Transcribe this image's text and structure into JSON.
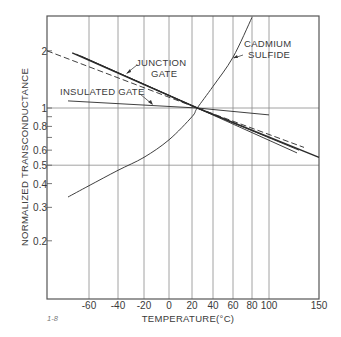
{
  "chart_data": {
    "type": "line",
    "title": "",
    "figure_label": "1-8",
    "xlabel": "TEMPERATURE(°C)",
    "ylabel": "NORMALIZED TRANSCONDUCTANCE",
    "xscale": "nonuniform",
    "yscale": "log",
    "xlim": [
      -80,
      150
    ],
    "ylim": [
      0.1,
      3.0
    ],
    "grid": true,
    "x_ticks": [
      -60,
      -40,
      -20,
      0,
      20,
      40,
      60,
      80,
      100,
      150
    ],
    "x_tick_labels": [
      "-60",
      "-40",
      "-20",
      "0",
      "20",
      "40",
      "60",
      "80",
      "100",
      "150"
    ],
    "y_ticks": [
      2,
      1,
      0.8,
      0.6,
      0.5,
      0.4,
      0.3,
      0.2
    ],
    "y_tick_labels": [
      "2",
      "1",
      "0.8",
      "0.6",
      "0.5",
      "0.4",
      "0.3",
      "0.2"
    ],
    "y_minor_ticks": [
      0.9,
      0.7
    ],
    "y_gridlines": [
      1,
      0.5
    ],
    "series": [
      {
        "name": "JUNCTION GATE",
        "style": "solid",
        "points": [
          [
            -68,
            1.95
          ],
          [
            25,
            1.0
          ],
          [
            150,
            0.55
          ]
        ]
      },
      {
        "name": "JUNCTION GATE (variant 2)",
        "style": "solid",
        "points": [
          [
            -66,
            1.92
          ],
          [
            25,
            1.0
          ],
          [
            130,
            0.6
          ]
        ]
      },
      {
        "name": "JUNCTION GATE (variant 3)",
        "style": "solid",
        "points": [
          [
            -64,
            1.88
          ],
          [
            25,
            1.0
          ],
          [
            128,
            0.58
          ]
        ]
      },
      {
        "name": "JUNCTION GATE (dashed)",
        "style": "dashed",
        "points": [
          [
            -80,
            2.0
          ],
          [
            25,
            1.0
          ],
          [
            135,
            0.62
          ]
        ]
      },
      {
        "name": "INSULATED GATE",
        "style": "solid",
        "points": [
          [
            -70,
            1.09
          ],
          [
            25,
            1.0
          ],
          [
            100,
            0.92
          ]
        ]
      },
      {
        "name": "CADMIUM SULFIDE",
        "style": "solid",
        "points": [
          [
            -70,
            0.34
          ],
          [
            -60,
            0.39
          ],
          [
            -40,
            0.47
          ],
          [
            -20,
            0.55
          ],
          [
            0,
            0.68
          ],
          [
            20,
            0.9
          ],
          [
            25,
            1.0
          ],
          [
            40,
            1.3
          ],
          [
            60,
            1.85
          ],
          [
            80,
            3.0
          ]
        ]
      }
    ],
    "annotations": [
      {
        "text": "JUNCTION GATE",
        "line1": "JUNCTION",
        "line2": "GATE"
      },
      {
        "text": "INSULATED GATE"
      },
      {
        "text": "CADMIUM SULFIDE",
        "line1": "CADMIUM",
        "line2": "SULFIDE"
      }
    ]
  },
  "labels": {
    "junction_1": "JUNCTION",
    "junction_2": "GATE",
    "insulated": "INSULATED GATE",
    "cadmium_1": "CADMIUM",
    "cadmium_2": "SULFIDE",
    "xlabel": "TEMPERATURE(°C)",
    "ylabel": "NORMALIZED TRANSCONDUCTANCE",
    "figure": "1-8"
  }
}
